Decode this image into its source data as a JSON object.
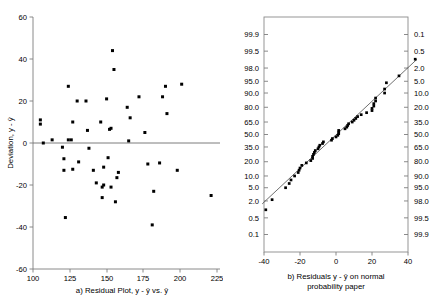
{
  "figure": {
    "title": "",
    "panels": [
      "a",
      "b"
    ],
    "background_color": "#ffffff",
    "point_color": "#000000",
    "axis_color": "#7d7d7d",
    "line_color": "#4a4a4a"
  },
  "panel_a": {
    "caption": "a) Residual Plot, y - ŷ vs. ŷ",
    "caption_prefix": "a) Residual Plot, y - ",
    "caption_mid": " vs. ",
    "y_axis_title_prefix": "Deviation, y - ",
    "y_axis_title": "Deviation, y - ŷ",
    "x_ticks": [
      "100",
      "125",
      "150",
      "175",
      "200",
      "225"
    ],
    "y_ticks": [
      "60",
      "40",
      "20",
      "0",
      "-20",
      "-40",
      "-60"
    ]
  },
  "panel_b": {
    "caption_line1": "b) Residuals y - ŷ on normal",
    "caption_line1_prefix": "b) Residuals y - ",
    "caption_line1_suffix": " on normal",
    "caption_line2": "probability paper",
    "x_ticks": [
      "-40",
      "-20",
      "0",
      "20",
      "40"
    ],
    "y_ticks_left": [
      "99.9",
      "99.5",
      "98.0",
      "95.0",
      "90.0",
      "80.0",
      "65.0",
      "50.0",
      "35.0",
      "20.0",
      "10.0",
      "5.0",
      "2.0",
      "0.5",
      "0.1"
    ],
    "y_ticks_right": [
      "0.1",
      "0.5",
      "2.0",
      "5.0",
      "10.0",
      "20.0",
      "35.0",
      "50.0",
      "65.0",
      "80.0",
      "90.0",
      "95.0",
      "98.0",
      "99.5",
      "99.9"
    ]
  },
  "chart_data": [
    {
      "type": "scatter",
      "id": "residual-plot",
      "title": "a) Residual Plot, y - ŷ vs. ŷ",
      "xlabel": "ŷ (fitted value)",
      "ylabel": "Deviation, y - ŷ",
      "xlim": [
        100,
        228
      ],
      "ylim": [
        -60,
        60
      ],
      "xticks": [
        100,
        125,
        150,
        175,
        200,
        225
      ],
      "yticks": [
        -60,
        -40,
        -20,
        0,
        20,
        40,
        60
      ],
      "grid": false,
      "legend": "none",
      "reference_line": {
        "type": "horizontal",
        "y": 0
      },
      "points": [
        [
          105,
          11
        ],
        [
          105,
          9
        ],
        [
          107,
          0
        ],
        [
          113,
          1.5
        ],
        [
          120,
          -2
        ],
        [
          121,
          -7.5
        ],
        [
          121,
          -13
        ],
        [
          122,
          -35.5
        ],
        [
          124,
          27
        ],
        [
          124,
          1.5
        ],
        [
          126,
          1.5
        ],
        [
          127,
          -12.5
        ],
        [
          127,
          10
        ],
        [
          130,
          20
        ],
        [
          131,
          -9
        ],
        [
          136,
          20
        ],
        [
          137,
          6
        ],
        [
          138,
          -2.5
        ],
        [
          141,
          -13
        ],
        [
          143,
          -19
        ],
        [
          146,
          10
        ],
        [
          147,
          -21
        ],
        [
          147,
          -26
        ],
        [
          148,
          -20
        ],
        [
          148,
          -11.5
        ],
        [
          150,
          21
        ],
        [
          151,
          -7
        ],
        [
          152,
          6.5
        ],
        [
          153,
          7
        ],
        [
          153,
          -21
        ],
        [
          154,
          44
        ],
        [
          155,
          35
        ],
        [
          156,
          -28
        ],
        [
          157,
          -16.5
        ],
        [
          158,
          -14
        ],
        [
          164,
          17
        ],
        [
          165,
          1
        ],
        [
          166,
          12
        ],
        [
          172,
          22
        ],
        [
          176,
          5
        ],
        [
          178,
          -10
        ],
        [
          181,
          -39
        ],
        [
          182,
          -23
        ],
        [
          186,
          -9.5
        ],
        [
          188,
          22
        ],
        [
          190,
          27
        ],
        [
          191,
          14
        ],
        [
          198,
          -13
        ],
        [
          201,
          28
        ],
        [
          221,
          -25
        ]
      ]
    },
    {
      "type": "scatter",
      "id": "normal-probability-plot",
      "title": "b) Residuals y - ŷ on normal probability paper",
      "xlabel": "Residual value",
      "ylabel": "Cumulative percent",
      "xlim": [
        -45,
        45
      ],
      "ylim": [
        0.1,
        99.9
      ],
      "xticks": [
        -40,
        -20,
        0,
        20,
        40
      ],
      "yticks_left": [
        99.9,
        99.5,
        98.0,
        95.0,
        90.0,
        80.0,
        65.0,
        50.0,
        35.0,
        20.0,
        10.0,
        5.0,
        2.0,
        0.5,
        0.1
      ],
      "yticks_right": [
        0.1,
        0.5,
        2.0,
        5.0,
        10.0,
        20.0,
        35.0,
        50.0,
        65.0,
        80.0,
        90.0,
        95.0,
        98.0,
        99.5,
        99.9
      ],
      "yscale": "normal-probability",
      "grid": false,
      "legend": "none",
      "fit_line": {
        "from": [
          -41,
          1.6
        ],
        "to": [
          45,
          99.0
        ]
      },
      "points": [
        [
          -39,
          1.0
        ],
        [
          -35.5,
          2.2
        ],
        [
          -28,
          5.0
        ],
        [
          -26,
          6.5
        ],
        [
          -25,
          8.0
        ],
        [
          -23,
          10.0
        ],
        [
          -21,
          12.0
        ],
        [
          -20.5,
          13.5
        ],
        [
          -20,
          15.0
        ],
        [
          -19,
          17.0
        ],
        [
          -16.5,
          19.0
        ],
        [
          -14,
          21.0
        ],
        [
          -13,
          23.0
        ],
        [
          -13,
          25.0
        ],
        [
          -12.5,
          27.0
        ],
        [
          -12,
          29.0
        ],
        [
          -11.5,
          31.0
        ],
        [
          -10,
          33.0
        ],
        [
          -9.5,
          35.0
        ],
        [
          -9,
          37.0
        ],
        [
          -7.5,
          39.0
        ],
        [
          -7,
          41.0
        ],
        [
          -2.5,
          43.0
        ],
        [
          -2,
          45.0
        ],
        [
          0,
          47.0
        ],
        [
          1,
          49.0
        ],
        [
          1.5,
          51.0
        ],
        [
          1.5,
          53.0
        ],
        [
          1.5,
          55.0
        ],
        [
          5,
          57.0
        ],
        [
          6,
          59.0
        ],
        [
          6.5,
          61.0
        ],
        [
          7,
          63.0
        ],
        [
          9,
          65.0
        ],
        [
          10,
          67.0
        ],
        [
          11,
          69.0
        ],
        [
          12,
          71.0
        ],
        [
          14,
          73.0
        ],
        [
          17,
          75.0
        ],
        [
          20,
          77.0
        ],
        [
          20,
          79.0
        ],
        [
          21,
          81.0
        ],
        [
          21,
          83.0
        ],
        [
          22,
          85.0
        ],
        [
          22,
          87.0
        ],
        [
          27,
          90.0
        ],
        [
          27,
          92.0
        ],
        [
          28,
          94.5
        ],
        [
          35,
          96.5
        ],
        [
          44,
          99.0
        ]
      ]
    }
  ]
}
